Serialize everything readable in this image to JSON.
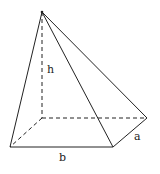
{
  "diagram": {
    "type": "rectangular pyramid",
    "labels": {
      "height": "h",
      "depth": "a",
      "width": "b"
    },
    "colors": {
      "line": "#222222",
      "background": "#ffffff"
    }
  }
}
